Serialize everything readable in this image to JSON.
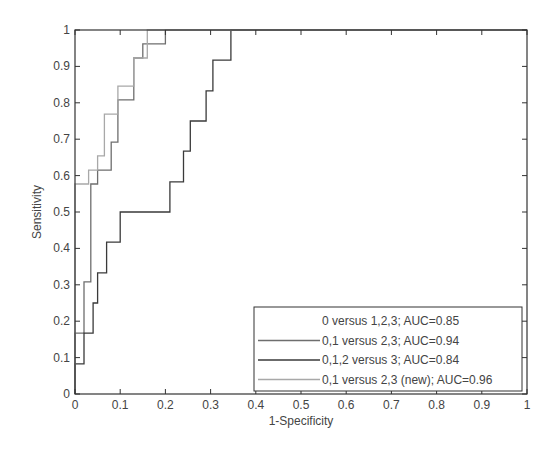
{
  "chart_data": {
    "type": "line",
    "title": "",
    "xlabel": "1-Specificity",
    "ylabel": "Sensitivity",
    "xlim": [
      0,
      1
    ],
    "ylim": [
      0,
      1
    ],
    "grid": false,
    "legend_position": "lower right",
    "x_ticks": [
      "0",
      "0.1",
      "0.2",
      "0.3",
      "0.4",
      "0.5",
      "0.6",
      "0.7",
      "0.8",
      "0.9",
      "1"
    ],
    "y_ticks": [
      "0",
      "0.1",
      "0.2",
      "0.3",
      "0.4",
      "0.5",
      "0.6",
      "0.7",
      "0.8",
      "0.9",
      "1"
    ],
    "series": [
      {
        "name": "0 versus 1,2,3; AUC=0.85",
        "color": "#ffffff",
        "show_line": false,
        "x": [],
        "y": []
      },
      {
        "name": "0,1 versus 2,3; AUC=0.94",
        "color": "#6e6e6e",
        "show_line": true,
        "x": [
          0,
          0,
          0.02,
          0.02,
          0.035,
          0.035,
          0.05,
          0.05,
          0.08,
          0.08,
          0.095,
          0.095,
          0.13,
          0.13,
          0.15,
          0.15,
          0.2,
          0.2,
          1
        ],
        "y": [
          0,
          0.167,
          0.167,
          0.308,
          0.308,
          0.577,
          0.577,
          0.615,
          0.615,
          0.692,
          0.692,
          0.808,
          0.808,
          0.923,
          0.923,
          0.962,
          0.962,
          1,
          1
        ]
      },
      {
        "name": "0,1,2 versus 3; AUC=0.84",
        "color": "#3a3a3a",
        "show_line": true,
        "x": [
          0,
          0,
          0.02,
          0.02,
          0.04,
          0.04,
          0.05,
          0.05,
          0.07,
          0.07,
          0.1,
          0.1,
          0.21,
          0.21,
          0.24,
          0.24,
          0.255,
          0.255,
          0.29,
          0.29,
          0.305,
          0.305,
          0.345,
          0.345,
          1
        ],
        "y": [
          0,
          0.083,
          0.083,
          0.167,
          0.167,
          0.25,
          0.25,
          0.333,
          0.333,
          0.417,
          0.417,
          0.5,
          0.5,
          0.583,
          0.583,
          0.667,
          0.667,
          0.75,
          0.75,
          0.833,
          0.833,
          0.917,
          0.917,
          1,
          1
        ]
      },
      {
        "name": "0,1 versus 2,3 (new); AUC=0.96",
        "color": "#a8a8a8",
        "show_line": true,
        "x": [
          0,
          0,
          0.03,
          0.03,
          0.05,
          0.05,
          0.065,
          0.065,
          0.095,
          0.095,
          0.13,
          0.13,
          0.16,
          0.16,
          0.16,
          1
        ],
        "y": [
          0,
          0.577,
          0.577,
          0.615,
          0.615,
          0.654,
          0.654,
          0.769,
          0.769,
          0.846,
          0.846,
          0.923,
          0.923,
          0.962,
          1,
          1
        ]
      }
    ]
  },
  "legend": {
    "entries": [
      "0 versus 1,2,3; AUC=0.85",
      "0,1 versus 2,3; AUC=0.94",
      "0,1,2 versus 3; AUC=0.84",
      "0,1 versus 2,3 (new); AUC=0.96"
    ]
  },
  "axes": {
    "xlabel": "1-Specificity",
    "ylabel": "Sensitivity"
  }
}
